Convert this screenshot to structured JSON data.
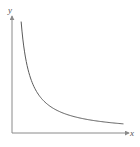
{
  "chart_data": {
    "type": "line",
    "title": "",
    "xlabel": "x",
    "ylabel": "y",
    "grid": false,
    "legend": null,
    "ticks": {
      "x": [],
      "y": []
    },
    "series": [
      {
        "name": "y = k/x",
        "description": "decreasing hyperbola approaching both axes asymptotically",
        "x": [
          0.08,
          0.1,
          0.12,
          0.15,
          0.2,
          0.3,
          0.4,
          0.5,
          0.6,
          0.7,
          0.8,
          0.9,
          1.0
        ],
        "values": [
          1.0,
          0.8,
          0.667,
          0.533,
          0.4,
          0.267,
          0.2,
          0.16,
          0.133,
          0.114,
          0.1,
          0.089,
          0.08
        ]
      }
    ],
    "xlim": [
      0,
      1.05
    ],
    "ylim": [
      0,
      1.05
    ]
  },
  "colors": {
    "axis": "#8a8a8a",
    "curve": "#5a5a5a",
    "label": "#555555"
  }
}
